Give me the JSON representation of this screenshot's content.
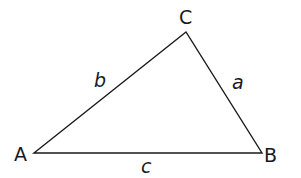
{
  "diagram": {
    "type": "triangle",
    "stroke_color": "#1a1a1a",
    "background": "#ffffff",
    "vertices": [
      {
        "id": "A",
        "label": "A",
        "x": 34,
        "y": 153,
        "label_x": 14,
        "label_y": 161
      },
      {
        "id": "B",
        "label": "B",
        "x": 262,
        "y": 153,
        "label_x": 264,
        "label_y": 162
      },
      {
        "id": "C",
        "label": "C",
        "x": 186,
        "y": 32,
        "label_x": 179,
        "label_y": 24
      }
    ],
    "sides": [
      {
        "id": "a",
        "label": "a",
        "from": "B",
        "to": "C",
        "label_x": 232,
        "label_y": 89
      },
      {
        "id": "b",
        "label": "b",
        "from": "A",
        "to": "C",
        "label_x": 94,
        "label_y": 87
      },
      {
        "id": "c",
        "label": "c",
        "from": "A",
        "to": "B",
        "label_x": 141,
        "label_y": 173
      }
    ]
  }
}
